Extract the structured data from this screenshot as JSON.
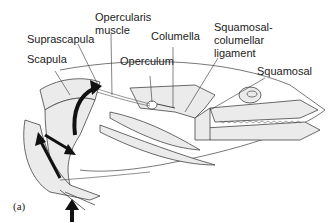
{
  "figure": {
    "panel_label": "(a)",
    "labels": {
      "opercularis_muscle_1": "Opercularis",
      "opercularis_muscle_2": "muscle",
      "suprascapula": "Suprascapula",
      "scapula": "Scapula",
      "columella": "Columella",
      "operculum": "Operculum",
      "sq_col_lig_1": "Squamosal-",
      "sq_col_lig_2": "columellar",
      "sq_col_lig_3": "ligament",
      "squamosal": "Squamosal"
    },
    "colors": {
      "bone_fill": "#ebebeb",
      "outline": "#444444",
      "arrow": "#111111"
    }
  }
}
